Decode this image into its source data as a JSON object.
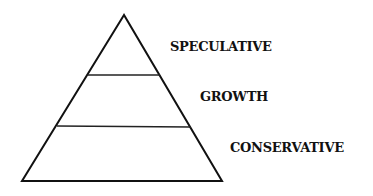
{
  "diagram": {
    "type": "pyramid",
    "tiers": [
      {
        "position": "top",
        "label": "SPECULATIVE"
      },
      {
        "position": "middle",
        "label": "GROWTH"
      },
      {
        "position": "bottom",
        "label": "CONSERVATIVE"
      }
    ],
    "colors": {
      "stroke": "#111111",
      "background": "#ffffff",
      "text": "#111111"
    }
  }
}
